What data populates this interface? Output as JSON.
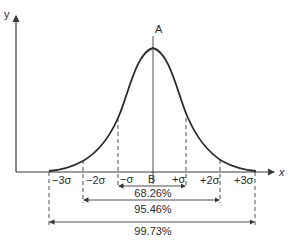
{
  "diagram": {
    "axes": {
      "x_label": "x",
      "y_label": "y"
    },
    "peak_label": "A",
    "center_label": "B",
    "sigma_labels": {
      "m3": "−3σ",
      "m2": "−2σ",
      "m1": "−σ",
      "p1": "+σ",
      "p2": "+2σ",
      "p3": "+3σ"
    },
    "intervals": [
      {
        "range": "±1σ",
        "label": "68.26%"
      },
      {
        "range": "±2σ",
        "label": "95.46%"
      },
      {
        "range": "±3σ",
        "label": "99.73%"
      }
    ],
    "colors": {
      "line": "#2a2a2a",
      "background": "#ffffff"
    }
  }
}
